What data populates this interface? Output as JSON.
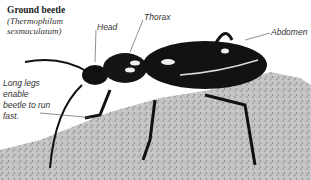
{
  "figure": {
    "title": "Ground beetle",
    "scientific_name": "(Thermophilum sexmaculatum)",
    "labels": {
      "head": "Head",
      "thorax": "Thorax",
      "abdomen": "Abdomen"
    },
    "caption": "Long legs enable beetle to run fast.",
    "colors": {
      "beetle": "#111111",
      "rock": "#b8b8b8",
      "background": "#ffffff",
      "text": "#333333"
    }
  }
}
